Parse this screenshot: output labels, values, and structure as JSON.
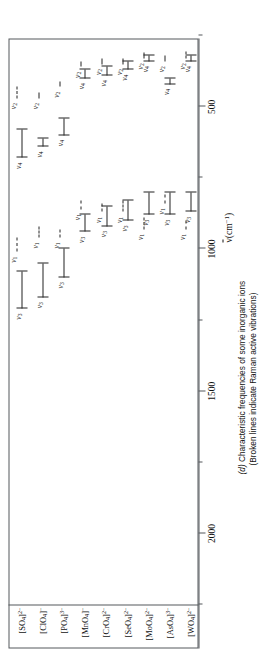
{
  "figure": {
    "caption_line1": "(d) Characteristic frequencies of some inorganic ions",
    "caption_line2": "(Broken lines indicate Raman active vibrations)",
    "caption_tag": "(d)",
    "axis_title_symbol": "ν",
    "axis_title_unit": "(cm",
    "axis_title_exp": "−1",
    "axis_title_close": ")"
  },
  "chart_data": {
    "type": "range-bar",
    "title": "Characteristic frequencies of some inorganic ions",
    "subtitle": "(Broken lines indicate Raman active vibrations)",
    "xlabel": "ṽ (cm⁻¹)",
    "ylabel": "",
    "xlim": [
      2250,
      260
    ],
    "x_direction": "decreasing",
    "grid": false,
    "legend": "Broken lines indicate Raman active vibrations",
    "axis_ticks_major": [
      2000,
      1500,
      1000,
      500
    ],
    "axis_ticks_minor": [
      2250,
      1750,
      1250,
      750,
      250
    ],
    "axis_tick_labels": [
      "2000",
      "1500",
      "1000",
      "500"
    ],
    "categories": [
      "[SO4]2-",
      "[ClO4]-",
      "[PO4]3-",
      "[MnO4]-",
      "[CrO4]2-",
      "[SeO4]2-",
      "[MoO4]2-",
      "[AsO4]3-",
      "[WO4]2-"
    ],
    "series": [
      {
        "name": "[SO4]2-",
        "label_html": "[SO<sub>4</sub>]<sup>2−</sup>",
        "bands": [
          {
            "mode": "ν3",
            "style": "solid",
            "from": 1210,
            "to": 1080,
            "label": "ν3"
          },
          {
            "mode": "ν1",
            "style": "dashed",
            "from": 1010,
            "to": 960,
            "label": "ν1"
          },
          {
            "mode": "ν4",
            "style": "solid",
            "from": 680,
            "to": 580,
            "label": "ν4"
          },
          {
            "mode": "ν2",
            "style": "dashed",
            "from": 470,
            "to": 430,
            "label": "ν2"
          }
        ]
      },
      {
        "name": "[ClO4]-",
        "label_html": "[ClO<sub>4</sub>]<sup>−</sup>",
        "bands": [
          {
            "mode": "ν3",
            "style": "solid",
            "from": 1170,
            "to": 1050,
            "label": "ν3"
          },
          {
            "mode": "ν1",
            "style": "dashed",
            "from": 960,
            "to": 920,
            "label": "ν1"
          },
          {
            "mode": "ν4",
            "style": "solid",
            "from": 640,
            "to": 610,
            "label": "ν4"
          },
          {
            "mode": "ν2",
            "style": "dashed",
            "from": 470,
            "to": 450,
            "label": "ν2"
          }
        ]
      },
      {
        "name": "[PO4]3-",
        "label_html": "[PO<sub>4</sub>]<sup>3−</sup>",
        "bands": [
          {
            "mode": "ν3",
            "style": "solid",
            "from": 1100,
            "to": 1000,
            "label": "ν3"
          },
          {
            "mode": "ν1",
            "style": "dashed",
            "from": 960,
            "to": 930,
            "label": "ν1"
          },
          {
            "mode": "ν4",
            "style": "solid",
            "from": 600,
            "to": 540,
            "label": "ν4"
          },
          {
            "mode": "ν2",
            "style": "dashed",
            "from": 430,
            "to": 410,
            "label": "ν2"
          }
        ]
      },
      {
        "name": "[MnO4]-",
        "label_html": "[MnO<sub>4</sub>]<sup>−</sup>",
        "bands": [
          {
            "mode": "ν3",
            "style": "solid",
            "from": 940,
            "to": 880,
            "label": "ν3"
          },
          {
            "mode": "ν1",
            "style": "dashed",
            "from": 860,
            "to": 830,
            "label": "ν1"
          },
          {
            "mode": "ν4",
            "style": "solid",
            "from": 400,
            "to": 370,
            "label": "ν4"
          },
          {
            "mode": "ν2",
            "style": "dashed",
            "from": 360,
            "to": 340,
            "label": "ν2"
          }
        ]
      },
      {
        "name": "[CrO4]2-",
        "label_html": "[CrO<sub>4</sub>]<sup>2−</sup>",
        "bands": [
          {
            "mode": "ν3",
            "style": "solid",
            "from": 920,
            "to": 850,
            "label": "ν3"
          },
          {
            "mode": "ν1",
            "style": "dashed",
            "from": 870,
            "to": 840,
            "label": "ν1"
          },
          {
            "mode": "ν4",
            "style": "solid",
            "from": 390,
            "to": 360,
            "label": "ν4"
          },
          {
            "mode": "ν2",
            "style": "dashed",
            "from": 350,
            "to": 330,
            "label": "ν2"
          }
        ]
      },
      {
        "name": "[SeO4]2-",
        "label_html": "[SeO<sub>4</sub>]<sup>2−</sup>",
        "bands": [
          {
            "mode": "ν3",
            "style": "solid",
            "from": 900,
            "to": 830,
            "label": "ν3"
          },
          {
            "mode": "ν1",
            "style": "dashed",
            "from": 870,
            "to": 830,
            "label": "ν1"
          },
          {
            "mode": "ν4",
            "style": "solid",
            "from": 370,
            "to": 340,
            "label": "ν4"
          },
          {
            "mode": "ν2",
            "style": "dashed",
            "from": 350,
            "to": 330,
            "label": "ν2"
          }
        ]
      },
      {
        "name": "[MoO4]2-",
        "label_html": "[MoO<sub>4</sub>]<sup>2−</sup>",
        "bands": [
          {
            "mode": "ν3",
            "style": "solid",
            "from": 880,
            "to": 800,
            "label": "ν3"
          },
          {
            "mode": "ν1",
            "style": "dashed",
            "from": 930,
            "to": 890,
            "label": "ν1"
          },
          {
            "mode": "ν4",
            "style": "solid",
            "from": 340,
            "to": 320,
            "label": "ν4"
          },
          {
            "mode": "ν2",
            "style": "dashed",
            "from": 330,
            "to": 310,
            "label": "ν2"
          }
        ]
      },
      {
        "name": "[AsO4]3-",
        "label_html": "[AsO<sub>4</sub>]<sup>3−</sup>",
        "bands": [
          {
            "mode": "ν3",
            "style": "solid",
            "from": 880,
            "to": 800,
            "label": "ν3"
          },
          {
            "mode": "ν1",
            "style": "dashed",
            "from": 840,
            "to": 810,
            "label": "ν1"
          },
          {
            "mode": "ν4",
            "style": "solid",
            "from": 420,
            "to": 400,
            "label": "ν4"
          },
          {
            "mode": "ν2",
            "style": "dashed",
            "from": 340,
            "to": 320,
            "label": "ν2"
          }
        ]
      },
      {
        "name": "[WO4]2-",
        "label_html": "[WO<sub>4</sub>]<sup>2−</sup>",
        "bands": [
          {
            "mode": "ν3",
            "style": "solid",
            "from": 870,
            "to": 800,
            "label": "ν3"
          },
          {
            "mode": "ν1",
            "style": "dashed",
            "from": 930,
            "to": 900,
            "label": "ν1"
          },
          {
            "mode": "ν4",
            "style": "solid",
            "from": 340,
            "to": 320,
            "label": "ν4"
          },
          {
            "mode": "ν2",
            "style": "dashed",
            "from": 330,
            "to": 305,
            "label": "ν2"
          }
        ]
      }
    ]
  }
}
